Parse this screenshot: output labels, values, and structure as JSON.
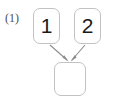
{
  "figure": {
    "caption": "(1)",
    "type": "node-graph-diagram"
  },
  "diagram": {
    "nodes": [
      {
        "id": "one",
        "label": "1",
        "shape": "rounded-rectangle"
      },
      {
        "id": "two",
        "label": "2",
        "shape": "rounded-rectangle"
      },
      {
        "id": "result",
        "label": "",
        "shape": "rounded-rectangle"
      }
    ],
    "edges": [
      {
        "from": "one",
        "to": "result",
        "style": "arrow"
      },
      {
        "from": "two",
        "to": "result",
        "style": "arrow"
      }
    ]
  },
  "colors": {
    "background": "#ffffff",
    "node_border": "#c2c2c2",
    "node_fill": "#ffffff",
    "node_text": "#1a1a1a",
    "edge": "#8c8c8c",
    "caption_text": "#4d4d4d"
  }
}
